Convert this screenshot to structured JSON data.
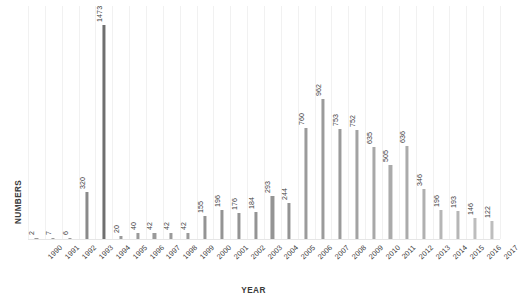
{
  "chart_data": {
    "type": "bar",
    "title": "",
    "xlabel": "YEAR",
    "ylabel": "NUMBERS",
    "grid": "vertical",
    "legend": "none",
    "ylim": [
      0,
      1600
    ],
    "categories": [
      "1990",
      "1991",
      "1992",
      "1993",
      "1994",
      "1995",
      "1996",
      "1997",
      "1998",
      "1999",
      "2000",
      "2001",
      "2002",
      "2003",
      "2004",
      "2005",
      "2006",
      "2007",
      "2008",
      "2009",
      "2010",
      "2011",
      "2012",
      "2013",
      "2014",
      "2015",
      "2016",
      "2017"
    ],
    "values": [
      2,
      7,
      6,
      320,
      1473,
      20,
      40,
      42,
      42,
      42,
      155,
      196,
      176,
      184,
      293,
      244,
      760,
      962,
      753,
      752,
      635,
      505,
      636,
      346,
      196,
      193,
      146,
      122
    ],
    "bar_colors": [
      "#9a9a9a",
      "#9a9a9a",
      "#9a9a9a",
      "#8a8a8a",
      "#6f6f6f",
      "#9a9a9a",
      "#9a9a9a",
      "#9a9a9a",
      "#9a9a9a",
      "#9a9a9a",
      "#949494",
      "#949494",
      "#949494",
      "#949494",
      "#949494",
      "#949494",
      "#9b9b9b",
      "#9b9b9b",
      "#9b9b9b",
      "#a3a3a3",
      "#a8a8a8",
      "#ababab",
      "#ababab",
      "#b0b0b0",
      "#b6b6b6",
      "#b6b6b6",
      "#bdbdbd",
      "#bdbdbd"
    ],
    "gridline_color": "#f1f1f1",
    "background_color": "#ffffff",
    "label_color": "#3c3c3c"
  }
}
